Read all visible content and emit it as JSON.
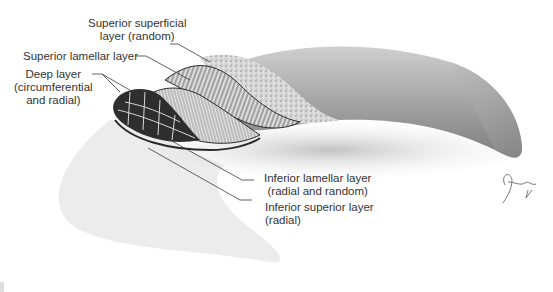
{
  "figure": {
    "labels": {
      "superior_superficial": {
        "line1": "Superior superficial",
        "line2": "layer (random)"
      },
      "superior_lamellar": {
        "line1": "Superior lamellar layer"
      },
      "deep": {
        "line1": "Deep layer",
        "line2": "(circumferential",
        "line3": "and radial)"
      },
      "inferior_lamellar": {
        "line1": "Inferior lamellar layer",
        "line2": "(radial and random)"
      },
      "inferior_superior": {
        "line1": "Inferior superior layer",
        "line2": "(radial)"
      }
    },
    "signature": "artist-signature",
    "colors": {
      "label_text": "#333333",
      "leader_line": "#3a3a3a",
      "shadow_shape": "#ececec",
      "meniscus_body": "#a8a8a8",
      "cross_section_dark": "#2a2a2a"
    }
  }
}
